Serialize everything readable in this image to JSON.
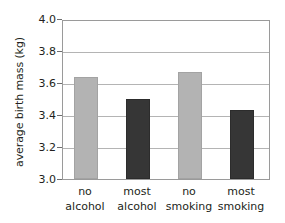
{
  "chart_data": {
    "type": "bar",
    "title": "",
    "xlabel": "",
    "ylabel": "average birth mass (kg)",
    "categories": [
      "no alcohol",
      "most alcohol",
      "no smoking",
      "most smoking"
    ],
    "category_lines": [
      [
        "no",
        "alcohol"
      ],
      [
        "most",
        "alcohol"
      ],
      [
        "no",
        "smoking"
      ],
      [
        "most",
        "smoking"
      ]
    ],
    "values": [
      3.64,
      3.5,
      3.67,
      3.43
    ],
    "bar_colors": [
      "#b3b3b3",
      "#363636",
      "#b3b3b3",
      "#363636"
    ],
    "ylim": [
      3.0,
      4.0
    ],
    "yticks": [
      "3.0",
      "3.2",
      "3.4",
      "3.6",
      "3.8",
      "4.0"
    ],
    "ytick_values": [
      3.0,
      3.2,
      3.4,
      3.6,
      3.8,
      4.0
    ],
    "grid": true,
    "legend": false,
    "legend_position": "none"
  },
  "colors": {
    "light_bar": "#b3b3b3",
    "dark_bar": "#363636",
    "gridline": "#b4b4b4",
    "frame": "#9a9a9a",
    "text": "#231f20",
    "background": "#ffffff"
  }
}
